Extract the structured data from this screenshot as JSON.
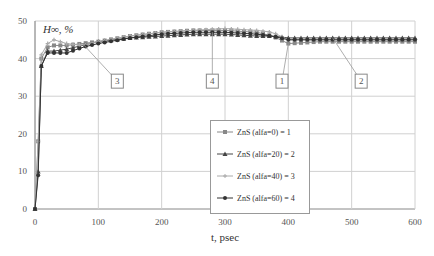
{
  "chart_data": {
    "type": "line",
    "title": "",
    "ylabel": "H∞, %",
    "xlabel": "t, psec",
    "xlim": [
      0,
      600
    ],
    "ylim": [
      0,
      50
    ],
    "xticks": [
      0,
      100,
      200,
      300,
      400,
      500,
      600
    ],
    "yticks": [
      0,
      10,
      20,
      30,
      40,
      50
    ],
    "grid": true,
    "legend_position": "center-right inside plot",
    "x": [
      0,
      5,
      10,
      20,
      30,
      50,
      75,
      100,
      150,
      200,
      250,
      300,
      350,
      375,
      400,
      450,
      500,
      550,
      600
    ],
    "series": [
      {
        "name": "ZnS (alfa=0) = 1",
        "marker": "square",
        "color": "#888888",
        "values": [
          0,
          18,
          40,
          43,
          43.5,
          43.5,
          44,
          44.5,
          46,
          47,
          47.5,
          47.5,
          47,
          46,
          44,
          44.5,
          44.5,
          44.5,
          44.5
        ]
      },
      {
        "name": "ZnS (alfa=20) = 2",
        "marker": "triangle",
        "color": "#444444",
        "values": [
          0,
          10,
          38,
          42,
          42,
          42.5,
          43.5,
          44.5,
          45.5,
          46,
          46.5,
          46.5,
          46,
          46,
          45.5,
          45.5,
          45.5,
          45.5,
          45.5
        ]
      },
      {
        "name": "ZnS (alfa=40) = 3",
        "marker": "plus",
        "color": "#aaaaaa",
        "values": [
          0,
          18,
          41,
          44,
          45,
          44,
          43.5,
          44.5,
          46,
          47,
          47.5,
          48,
          47.5,
          47,
          45,
          45,
          45,
          45,
          45
        ]
      },
      {
        "name": "ZnS (alfa=60) = 4",
        "marker": "circle",
        "color": "#333333",
        "values": [
          0,
          9,
          38,
          41.5,
          41.5,
          41.5,
          43,
          44,
          45.5,
          46.5,
          47,
          47,
          46.5,
          46,
          45,
          45,
          45,
          45,
          45
        ]
      }
    ],
    "annotations": [
      {
        "text": "3",
        "x": 130,
        "y": 34
      },
      {
        "text": "4",
        "x": 280,
        "y": 34
      },
      {
        "text": "1",
        "x": 390,
        "y": 34
      },
      {
        "text": "2",
        "x": 515,
        "y": 34
      }
    ]
  }
}
